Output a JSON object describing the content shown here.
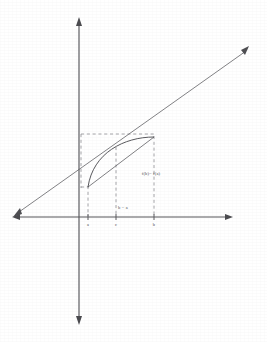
{
  "figure": {
    "kind": "mean-value-theorem-diagram",
    "background_color": "#ffffff",
    "ink_color": "#4f4f53",
    "dashed_color": "#8d8d92",
    "axes": {
      "x_axis_name": "horizontal-axis",
      "y_axis_name": "vertical-axis",
      "x_arrow_right": true,
      "x_arrow_left": true,
      "y_arrow_up": true,
      "y_arrow_down": true,
      "origin_x": 79,
      "origin_y": 217
    },
    "tick_labels": [
      {
        "label": "a",
        "x": 88
      },
      {
        "label": "c",
        "x": 116
      },
      {
        "label": "b",
        "x": 154
      }
    ],
    "annotations": [
      {
        "name": "rise-label",
        "text": "f(b)− f(a)",
        "x": 140,
        "y": 174
      },
      {
        "name": "run-label",
        "text": "b − a",
        "x": 118,
        "y": 208
      }
    ],
    "secant": {
      "name": "secant-line",
      "from": {
        "x": 14,
        "y": 216
      },
      "to": {
        "x": 250,
        "y": 48
      },
      "arrow_start": true,
      "arrow_end": true
    },
    "chord": {
      "name": "chord-segment",
      "from": {
        "x": 88,
        "y": 187
      },
      "to": {
        "x": 154,
        "y": 137
      }
    },
    "curve": {
      "name": "function-curve",
      "start": {
        "x": 88,
        "y": 187
      },
      "end": {
        "x": 154,
        "y": 137
      },
      "control_1": {
        "x": 94,
        "y": 152
      },
      "control_2": {
        "x": 126,
        "y": 138
      }
    },
    "dashed_guides": [
      {
        "name": "dashed-vertical-at-a",
        "x": 88,
        "y1": 187,
        "y2": 217
      },
      {
        "name": "dashed-vertical-at-c",
        "x": 116,
        "y1": 147,
        "y2": 217
      },
      {
        "name": "dashed-vertical-at-b",
        "x": 154,
        "y1": 137,
        "y2": 217
      },
      {
        "name": "dashed-horizontal-top",
        "y": 134,
        "x1": 81,
        "x2": 154
      },
      {
        "name": "dashed-horizontal-at-a",
        "y": 187,
        "x1": 81,
        "x2": 88
      },
      {
        "name": "dashed-vertical-left-edge",
        "x": 81,
        "y1": 134,
        "y2": 187
      }
    ]
  }
}
